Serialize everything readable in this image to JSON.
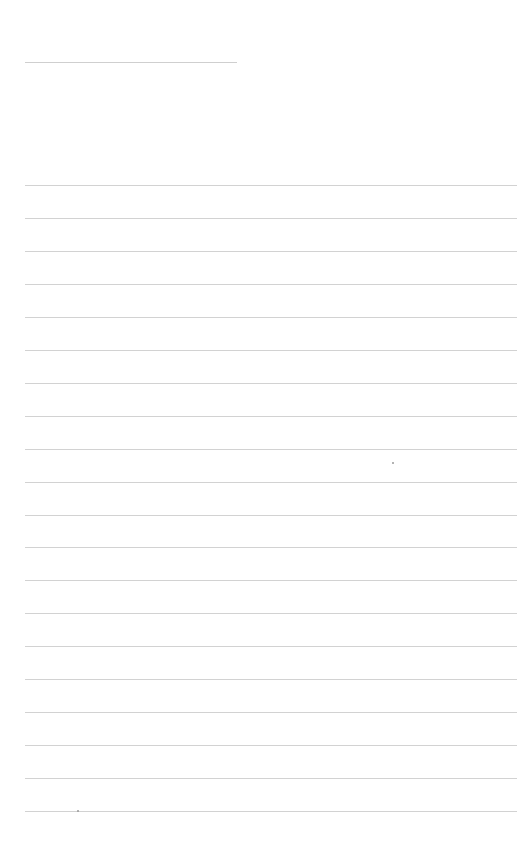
{
  "page": {
    "type": "lined-paper",
    "background_color": "#ffffff",
    "line_color": "#d2d2d2",
    "header_line": {
      "x": 25,
      "y": 62,
      "width": 212
    },
    "rules": {
      "count": 20,
      "x": 25,
      "width": 492,
      "first_y": 185,
      "spacing": 32.95
    },
    "specks": [
      {
        "x": 392,
        "y": 462
      },
      {
        "x": 77,
        "y": 810
      }
    ]
  }
}
